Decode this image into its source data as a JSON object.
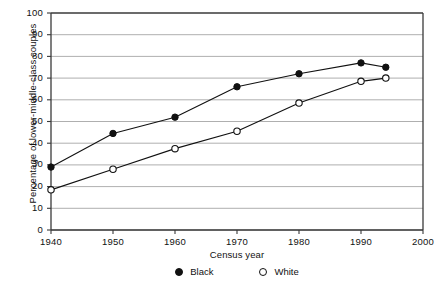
{
  "chart_data": {
    "type": "line",
    "title": "",
    "xlabel": "Census year",
    "ylabel": "Percentage of lower-middle-class couples",
    "xlim": [
      1940,
      2000
    ],
    "ylim": [
      0,
      100
    ],
    "xticks": [
      1940,
      1950,
      1960,
      1970,
      1980,
      1990,
      2000
    ],
    "yticks": [
      0,
      10,
      20,
      30,
      40,
      50,
      60,
      70,
      80,
      90,
      100
    ],
    "grid": "horizontal",
    "legend_position": "bottom-center",
    "series": [
      {
        "name": "Black",
        "marker": "filled-circle",
        "color": "#111111",
        "x": [
          1940,
          1950,
          1960,
          1970,
          1980,
          1990,
          1994
        ],
        "values": [
          29,
          44.5,
          52,
          66,
          72,
          77,
          75
        ]
      },
      {
        "name": "White",
        "marker": "open-circle",
        "color": "#111111",
        "x": [
          1940,
          1950,
          1960,
          1970,
          1980,
          1990,
          1994
        ],
        "values": [
          18.5,
          28,
          37.5,
          45.5,
          58.5,
          68.5,
          70
        ]
      }
    ]
  },
  "axis": {
    "y_title": "Percentage of lower-middle-class couples",
    "x_title": "Census year",
    "y_tick_labels": [
      "100",
      "90",
      "80",
      "70",
      "60",
      "50",
      "40",
      "30",
      "20",
      "10",
      "0"
    ],
    "x_tick_labels": [
      "1940",
      "1950",
      "1960",
      "1970",
      "1980",
      "1990",
      "2000"
    ]
  },
  "legend": {
    "entries": [
      {
        "label": "Black",
        "marker": "filled-circle"
      },
      {
        "label": "White",
        "marker": "open-circle"
      }
    ]
  },
  "colors": {
    "ink": "#111111",
    "grid": "#9a9a9a",
    "frame": "#3a3a3a",
    "background": "#ffffff"
  }
}
